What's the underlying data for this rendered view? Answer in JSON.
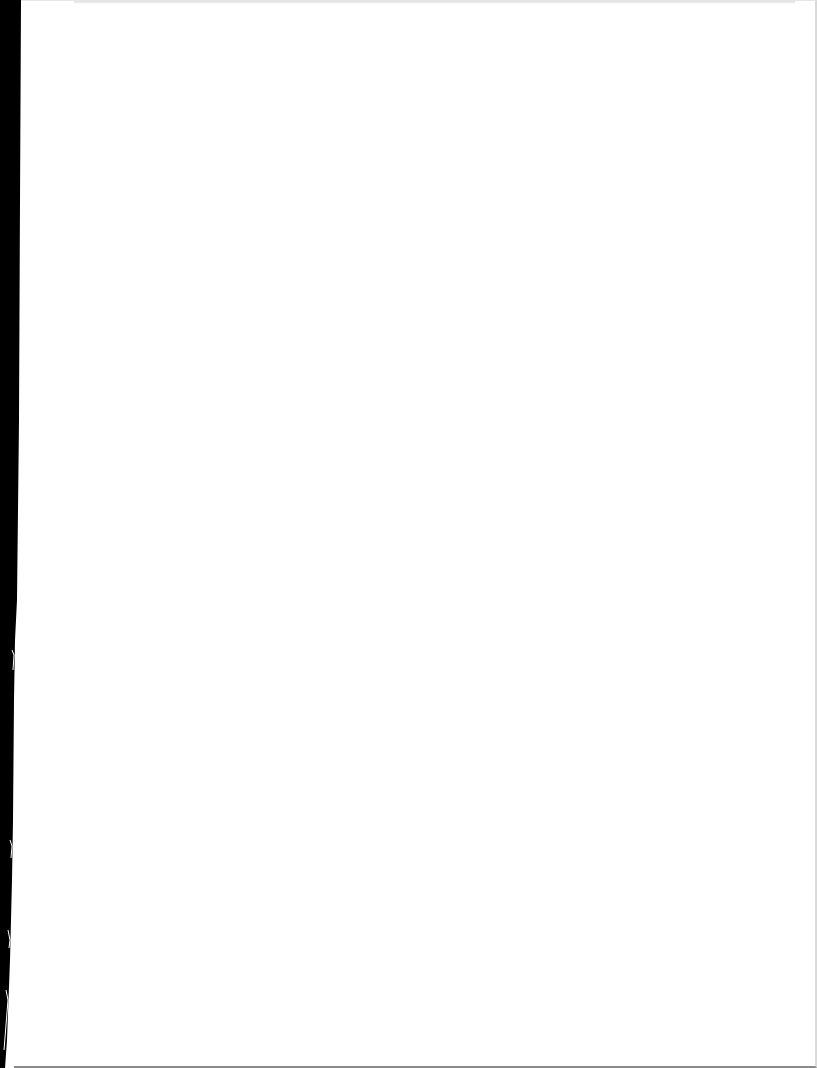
{
  "document": {
    "type": "scanned-page",
    "content": "",
    "colors": {
      "page": "#ffffff",
      "scan_edge": "#000000",
      "border": "#d9d9d9"
    }
  }
}
